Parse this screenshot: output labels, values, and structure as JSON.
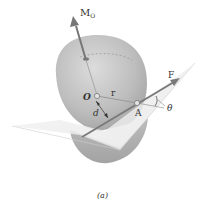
{
  "figure": {
    "caption": "(a)",
    "labels": {
      "moment": "M",
      "moment_subscript": "O",
      "origin": "O",
      "position_vector": "r",
      "point": "A",
      "force": "F",
      "angle": "θ",
      "moment_arm": "d"
    },
    "colors": {
      "sphere": "#b8b8b8",
      "sphere_highlight": "#d6d6d6",
      "sphere_shadow": "#9a9a9a",
      "plane": "#eeeeee",
      "arrow": "#7a7a7a",
      "text": "#333333",
      "background": "#ffffff"
    }
  }
}
